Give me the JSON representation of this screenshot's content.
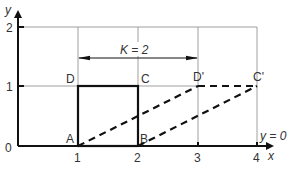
{
  "diagram": {
    "type": "shear-transformation",
    "axes": {
      "x_label": "x",
      "y_label": "y",
      "x_ticks": [
        "0",
        "1",
        "2",
        "3",
        "4"
      ],
      "y_ticks": [
        "1",
        "2"
      ],
      "origin_label": "0"
    },
    "shear_factor_label": "K = 2",
    "invariant_line_label": "y = 0",
    "original_square": {
      "style": "solid",
      "vertices": [
        {
          "label": "A",
          "x": 1,
          "y": 0
        },
        {
          "label": "B",
          "x": 2,
          "y": 0
        },
        {
          "label": "C",
          "x": 2,
          "y": 1
        },
        {
          "label": "D",
          "x": 1,
          "y": 1
        }
      ]
    },
    "image_parallelogram": {
      "style": "dashed",
      "vertices": [
        {
          "label": "A",
          "x": 1,
          "y": 0
        },
        {
          "label": "B",
          "x": 2,
          "y": 0
        },
        {
          "label": "C'",
          "x": 4,
          "y": 1
        },
        {
          "label": "D'",
          "x": 3,
          "y": 1
        }
      ]
    },
    "colors": {
      "axis": "#111111",
      "grid": "#888888",
      "shape": "#111111",
      "text": "#333333"
    }
  }
}
